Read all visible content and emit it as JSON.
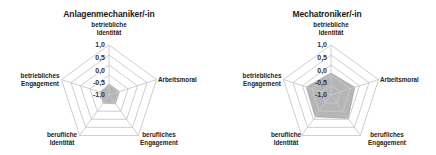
{
  "chart_data": [
    {
      "type": "radar",
      "title": "Anlagenmechaniker/-in",
      "axes": [
        "betriebliche Identität",
        "Arbeitsmoral",
        "berufliches Engagement",
        "berufliche Identität",
        "betriebliches Engagement"
      ],
      "values": [
        -0.95,
        -0.95,
        -0.95,
        -1.0,
        -1.05
      ],
      "rlim": [
        -1.5,
        1.0
      ],
      "tick_labels": [
        "1,0",
        "0,5",
        "0,0",
        "-0,5",
        "-1,0"
      ],
      "tick_values": [
        1.0,
        0.5,
        0.0,
        -0.5,
        -1.0
      ],
      "fill_color": "#b5b5b5",
      "grid_color": "#c8c8c8",
      "legend": false
    },
    {
      "type": "radar",
      "title": "Mechatroniker/-in",
      "axes": [
        "betriebliche Identität",
        "Arbeitsmoral",
        "berufliches Engagement",
        "berufliche Identität",
        "betriebliches Engagement"
      ],
      "values": [
        -0.4,
        -0.25,
        -0.05,
        -0.15,
        -0.2
      ],
      "rlim": [
        -1.5,
        1.0
      ],
      "tick_labels": [
        "1,0",
        "0,5",
        "0,0",
        "-0,5",
        "-1,0"
      ],
      "tick_values": [
        1.0,
        0.5,
        0.0,
        -0.5,
        -1.0
      ],
      "fill_color": "#b5b5b5",
      "grid_color": "#c8c8c8",
      "legend": false
    }
  ],
  "charts": [
    {
      "title": "Anlagenmechaniker/-in",
      "labels": {
        "top_1": "betriebliche",
        "top_2": "Identität",
        "right": "Arbeitsmoral",
        "br_1": "berufliches",
        "br_2": "Engagement",
        "bl_1": "berufliche",
        "bl_2": "Identität",
        "left_1": "betriebliches",
        "left_2": "Engagement"
      },
      "ticks": [
        "1,0",
        "0,5",
        "0,0",
        "-0,5",
        "-1,0"
      ]
    },
    {
      "title": "Mechatroniker/-in",
      "labels": {
        "top_1": "betriebliche",
        "top_2": "Identität",
        "right": "Arbeitsmoral",
        "br_1": "berufliches",
        "br_2": "Engagement",
        "bl_1": "berufliche",
        "bl_2": "Identität",
        "left_1": "betriebliches",
        "left_2": "Engagement"
      },
      "ticks": [
        "1,0",
        "0,5",
        "0,0",
        "-0,5",
        "-1,0"
      ]
    }
  ]
}
